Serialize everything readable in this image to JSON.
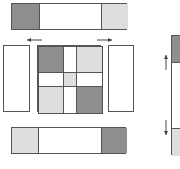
{
  "colors": {
    "dark": "#8e8e8e",
    "light": "#dedede",
    "white": "#ffffff",
    "border": "#555555",
    "arrow": "#444444"
  },
  "top_bar": {
    "x": 11,
    "y": 3,
    "w": 116,
    "h": 27,
    "cells": [
      {
        "fill": "dark",
        "w": 27
      },
      {
        "fill": "white",
        "w": 62
      },
      {
        "fill": "light",
        "w": 27
      }
    ]
  },
  "left_panel": {
    "x": 3,
    "y": 45,
    "w": 27,
    "h": 67,
    "fill": "white"
  },
  "right_panel": {
    "x": 108,
    "y": 45,
    "w": 26,
    "h": 67,
    "fill": "white"
  },
  "center_grid": {
    "x": 37,
    "y": 45,
    "w": 64,
    "h": 67,
    "columns": [
      25,
      13,
      26
    ],
    "rows": [
      26,
      14,
      27
    ],
    "cells": [
      [
        "dark",
        "white",
        "light"
      ],
      [
        "white",
        "light",
        "white"
      ],
      [
        "light",
        "white",
        "dark"
      ]
    ]
  },
  "bottom_bar": {
    "x": 11,
    "y": 127,
    "w": 115,
    "h": 27,
    "cells": [
      {
        "fill": "light",
        "w": 26
      },
      {
        "fill": "white",
        "w": 63
      },
      {
        "fill": "dark",
        "w": 26
      }
    ]
  },
  "side_bar": {
    "x": 171,
    "y": 35,
    "w": 20,
    "h": 120,
    "cells": [
      {
        "fill": "dark",
        "h": 26
      },
      {
        "fill": "white",
        "h": 66
      },
      {
        "fill": "light",
        "h": 28
      }
    ]
  },
  "arrows": [
    {
      "name": "arrow-left-icon",
      "direction": "left",
      "x1": 42,
      "y1": 40,
      "x2": 27,
      "y2": 40
    },
    {
      "name": "arrow-right-icon",
      "direction": "right",
      "x1": 97,
      "y1": 40,
      "x2": 112,
      "y2": 40
    },
    {
      "name": "arrow-up-icon",
      "direction": "up",
      "x1": 166,
      "y1": 70,
      "x2": 166,
      "y2": 55
    },
    {
      "name": "arrow-down-icon",
      "direction": "down",
      "x1": 166,
      "y1": 120,
      "x2": 166,
      "y2": 135
    }
  ]
}
